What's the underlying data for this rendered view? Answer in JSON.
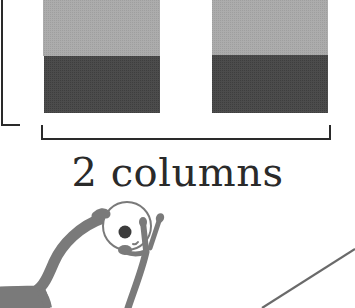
{
  "figure": {
    "label": "2 columns",
    "columns": [
      {
        "id": "column-1",
        "x": 43,
        "width": 117,
        "top_segment": {
          "y": 0,
          "height": 56,
          "color": "#a9a9a9"
        },
        "bottom_segment": {
          "y": 56,
          "height": 57,
          "color": "#484848"
        }
      },
      {
        "id": "column-2",
        "x": 212,
        "width": 116,
        "top_segment": {
          "y": 0,
          "height": 55,
          "color": "#a9a9a9"
        },
        "bottom_segment": {
          "y": 55,
          "height": 58,
          "color": "#484848"
        }
      }
    ],
    "colors": {
      "light_gray": "#a9a9a9",
      "dark_gray": "#484848",
      "bracket": "#2a2a2a",
      "figure_fill": "#7a7a7a",
      "eye": "#3c3c3c",
      "line": "#6a6a6a",
      "background": "#ffffff"
    },
    "icons": {
      "figure": "peeking-figure-icon",
      "left_bracket": "vertical-bracket",
      "bottom_bracket": "horizontal-bracket",
      "diagonal": "diagonal-line"
    }
  }
}
